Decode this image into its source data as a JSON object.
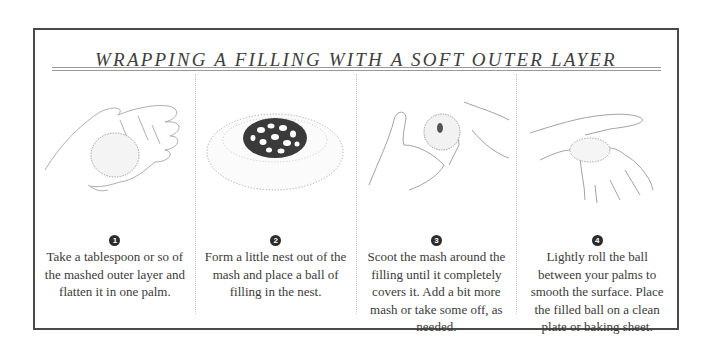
{
  "title": "WRAPPING A FILLING WITH A SOFT OUTER LAYER",
  "steps": [
    {
      "number": "1",
      "illustration": "open-palm-holding-flattened-patty",
      "caption": "Take a tablespoon or so of the mashed outer layer and flatten it in one palm."
    },
    {
      "number": "2",
      "illustration": "nest-of-mash-with-filling-ball",
      "caption": "Form a little nest out of the mash and place a ball of filling in the nest."
    },
    {
      "number": "3",
      "illustration": "hands-scooting-mash-around-filling",
      "caption": "Scoot the mash around the filling until it completely covers it. Add a bit more mash or take some off, as needed."
    },
    {
      "number": "4",
      "illustration": "palms-rolling-ball",
      "caption": "Lightly roll the ball between your palms to smooth the surface. Place the filled ball on a clean plate or baking sheet."
    }
  ]
}
